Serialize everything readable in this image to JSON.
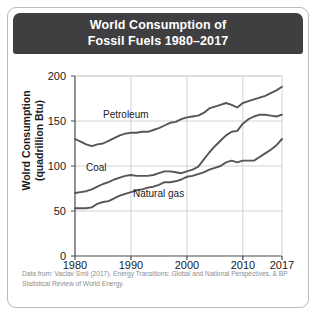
{
  "title": {
    "line1": "World Consumption of",
    "line2": "Fossil Fuels 1980–2017"
  },
  "caption": "Data from: Vaclav Smil (2017). Energy Transitions: Global and National Perspectives, & BP Statistical Review of World Energy.",
  "colors": {
    "title_bar": "#3f3f41",
    "line": "#55555a",
    "grid": "#d2d2d2",
    "axis": "#4a4a4a",
    "caption": "#8d8d8d"
  },
  "chart_data": {
    "type": "line",
    "title": "World Consumption of Fossil Fuels 1980–2017",
    "xlabel": "Year",
    "ylabel": "Wolrd Consumption (quadrillion Btu)",
    "ylabel_line1": "Wolrd Consumption",
    "ylabel_line2": "(quadrillion Btu)",
    "xlim": [
      1980,
      2017
    ],
    "ylim": [
      0,
      200
    ],
    "yticks": [
      0,
      50,
      100,
      150,
      200
    ],
    "ytick_labels": [
      "0",
      "50",
      "100",
      "150",
      "200"
    ],
    "xticks": [
      1980,
      1990,
      2000,
      2010,
      2017
    ],
    "xtick_labels": [
      "1980",
      "1990",
      "2000",
      "2010",
      "2017"
    ],
    "grid": true,
    "legend": "inline-labels",
    "x": [
      1980,
      1981,
      1982,
      1983,
      1984,
      1985,
      1986,
      1987,
      1988,
      1989,
      1990,
      1991,
      1992,
      1993,
      1994,
      1995,
      1996,
      1997,
      1998,
      1999,
      2000,
      2001,
      2002,
      2003,
      2004,
      2005,
      2006,
      2007,
      2008,
      2009,
      2010,
      2011,
      2012,
      2013,
      2014,
      2015,
      2016,
      2017
    ],
    "series": [
      {
        "name": "Petroleum",
        "label": "Petroleum",
        "values": [
          130,
          127,
          124,
          122,
          124,
          125,
          128,
          131,
          134,
          136,
          137,
          137,
          138,
          138,
          140,
          142,
          145,
          148,
          149,
          152,
          154,
          155,
          156,
          159,
          164,
          166,
          168,
          170,
          168,
          165,
          170,
          172,
          174,
          176,
          178,
          181,
          184,
          188
        ]
      },
      {
        "name": "Coal",
        "label": "Coal",
        "values": [
          70,
          71,
          72,
          74,
          77,
          80,
          82,
          85,
          87,
          89,
          90,
          89,
          89,
          89,
          90,
          92,
          94,
          94,
          93,
          92,
          94,
          96,
          99,
          107,
          115,
          122,
          128,
          134,
          138,
          139,
          147,
          152,
          155,
          157,
          157,
          156,
          155,
          157
        ]
      },
      {
        "name": "Natural gas",
        "label": "Natural gas",
        "values": [
          53,
          53,
          53,
          54,
          58,
          60,
          61,
          64,
          67,
          69,
          71,
          73,
          74,
          76,
          77,
          79,
          82,
          82,
          83,
          85,
          88,
          89,
          91,
          93,
          96,
          98,
          100,
          104,
          106,
          104,
          106,
          106,
          106,
          110,
          114,
          118,
          123,
          130
        ]
      }
    ]
  }
}
